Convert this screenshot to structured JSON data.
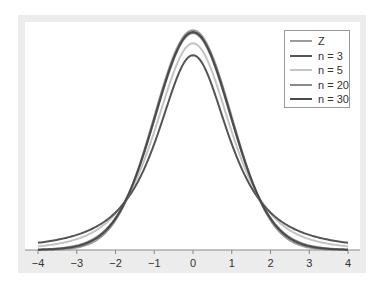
{
  "chart_data": {
    "type": "line",
    "title": "",
    "xlabel": "",
    "ylabel": "",
    "xlim": [
      -4,
      4
    ],
    "ylim": [
      0,
      0.4
    ],
    "grid": false,
    "legend_position": "upper right",
    "x_ticks": [
      "-4",
      "-3",
      "-2",
      "-1",
      "0",
      "1",
      "2",
      "3",
      "4"
    ],
    "x_tick_values": [
      -4,
      -3,
      -2,
      -1,
      0,
      1,
      2,
      3,
      4
    ],
    "series": [
      {
        "name": "Z",
        "distribution": "standard normal",
        "color": "#9a9a9a",
        "peak": 0.399
      },
      {
        "name": "n = 3",
        "distribution": "t, df=2",
        "color": "#555555",
        "peak": 0.354
      },
      {
        "name": "n = 5",
        "distribution": "t, df=4",
        "color": "#c4c4c4",
        "peak": 0.375
      },
      {
        "name": "n = 20",
        "distribution": "t, df=19",
        "color": "#8a8a8a",
        "peak": 0.394
      },
      {
        "name": "n = 30",
        "distribution": "t, df=29",
        "color": "#4a4a4a",
        "peak": 0.396
      }
    ]
  },
  "legend": {
    "items": [
      {
        "label": "Z",
        "color": "#9a9a9a"
      },
      {
        "label": "n = 3",
        "color": "#555555"
      },
      {
        "label": "n = 5",
        "color": "#c4c4c4"
      },
      {
        "label": "n = 20",
        "color": "#8a8a8a"
      },
      {
        "label": "n = 30",
        "color": "#4a4a4a"
      }
    ]
  },
  "axis": {
    "ticks": [
      "-4",
      "-3",
      "-2",
      "-1",
      "0",
      "1",
      "2",
      "3",
      "4"
    ]
  }
}
